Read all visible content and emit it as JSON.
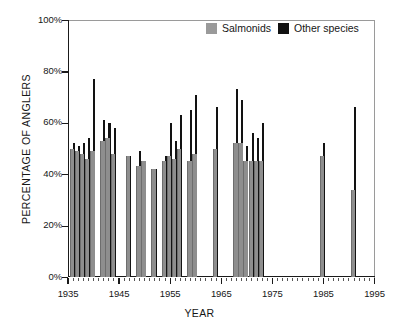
{
  "chart_data": {
    "type": "bar",
    "title": "",
    "xlabel": "YEAR",
    "ylabel": "PERCENTAGE OF ANGLERS",
    "xlim": [
      1935,
      1995
    ],
    "ylim": [
      0,
      100
    ],
    "grid": false,
    "legend_position": "top-right",
    "y_ticks": [
      "0%",
      "20%",
      "40%",
      "60%",
      "80%",
      "100%"
    ],
    "y_tick_values": [
      0,
      20,
      40,
      60,
      80,
      100
    ],
    "x_ticks": [
      "1935",
      "1945",
      "1955",
      "1965",
      "1975",
      "1985",
      "1995"
    ],
    "x_tick_values": [
      1935,
      1945,
      1955,
      1965,
      1975,
      1985,
      1995
    ],
    "legend": [
      "Salmonids",
      "Other species"
    ],
    "colors": {
      "salmonids": "#8e8e8e",
      "other_species": "#121212",
      "axis": "#1a1a1a",
      "background": "#ffffff"
    },
    "series": [
      {
        "name": "Salmonids",
        "color": "#8e8e8e",
        "values": [
          50,
          49,
          48,
          46,
          49,
          48,
          49,
          53,
          54,
          48,
          47,
          43,
          45,
          44,
          42,
          45,
          47,
          46,
          46,
          50,
          45,
          48,
          48,
          50,
          52,
          45,
          45,
          45,
          45,
          45,
          47,
          34
        ]
      },
      {
        "name": "Other species",
        "color": "#121212",
        "values": [
          52,
          51,
          52,
          54,
          77,
          61,
          60,
          58,
          58,
          47,
          47,
          49,
          45,
          45,
          42,
          47,
          60,
          53,
          63,
          65,
          71,
          66,
          73,
          69,
          51,
          56,
          54,
          60,
          60,
          60,
          52,
          66
        ]
      }
    ],
    "x": [
      1936,
      1937,
      1938,
      1939,
      1940,
      1941,
      1942,
      1943,
      1944,
      1945,
      1946,
      1947,
      1948,
      1949,
      1951,
      1953,
      1954,
      1955,
      1956,
      1957,
      1958,
      1959,
      1960,
      1961,
      1968,
      1969,
      1970,
      1971,
      1972,
      1973,
      1985,
      1991
    ],
    "points": [
      {
        "year": 1936,
        "salmonids": 50,
        "other": 52
      },
      {
        "year": 1937,
        "salmonids": 49,
        "other": 51
      },
      {
        "year": 1938,
        "salmonids": 48,
        "other": 52
      },
      {
        "year": 1939,
        "salmonids": 46,
        "other": 54
      },
      {
        "year": 1940,
        "salmonids": 49,
        "other": 77
      },
      {
        "year": 1942,
        "salmonids": 53,
        "other": 61
      },
      {
        "year": 1943,
        "salmonids": 54,
        "other": 60
      },
      {
        "year": 1944,
        "salmonids": 48,
        "other": 58
      },
      {
        "year": 1947,
        "salmonids": 47,
        "other": 47
      },
      {
        "year": 1949,
        "salmonids": 43,
        "other": 49
      },
      {
        "year": 1950,
        "salmonids": 45,
        "other": 45
      },
      {
        "year": 1952,
        "salmonids": 42,
        "other": 42
      },
      {
        "year": 1954,
        "salmonids": 45,
        "other": 47
      },
      {
        "year": 1955,
        "salmonids": 47,
        "other": 60
      },
      {
        "year": 1956,
        "salmonids": 46,
        "other": 53
      },
      {
        "year": 1957,
        "salmonids": 50,
        "other": 63
      },
      {
        "year": 1959,
        "salmonids": 45,
        "other": 65
      },
      {
        "year": 1960,
        "salmonids": 48,
        "other": 71
      },
      {
        "year": 1964,
        "salmonids": 50,
        "other": 66
      },
      {
        "year": 1968,
        "salmonids": 52,
        "other": 73
      },
      {
        "year": 1969,
        "salmonids": 52,
        "other": 69
      },
      {
        "year": 1970,
        "salmonids": 45,
        "other": 51
      },
      {
        "year": 1971,
        "salmonids": 45,
        "other": 56
      },
      {
        "year": 1972,
        "salmonids": 45,
        "other": 54
      },
      {
        "year": 1973,
        "salmonids": 45,
        "other": 60
      },
      {
        "year": 1985,
        "salmonids": 47,
        "other": 52
      },
      {
        "year": 1991,
        "salmonids": 34,
        "other": 66
      }
    ]
  },
  "axes": {
    "y_title": "PERCENTAGE OF ANGLERS",
    "x_title": "YEAR",
    "y_labels": [
      "100%",
      "80%",
      "60%",
      "40%",
      "20%",
      "0%"
    ],
    "x_labels": [
      "1935",
      "1945",
      "1955",
      "1965",
      "1975",
      "1985",
      "1995"
    ]
  },
  "legend": {
    "items": [
      {
        "label": "Salmonids",
        "swatch": "gray-swatch-icon"
      },
      {
        "label": "Other species",
        "swatch": "black-swatch-icon"
      }
    ]
  }
}
